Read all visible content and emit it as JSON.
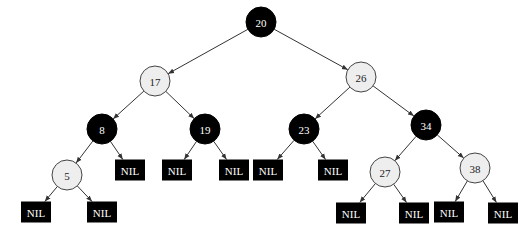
{
  "diagram": {
    "type": "red-black-tree",
    "colors": {
      "black_node_fill": "#000000",
      "black_node_text": "#ffffff",
      "red_node_fill": "#eeeeee",
      "red_node_stroke": "#444444",
      "red_node_text": "#222222",
      "nil_fill": "#000000",
      "nil_text": "#ffffff",
      "edge": "#333333"
    },
    "nodes": [
      {
        "id": "n20",
        "label": "20",
        "color": "black",
        "x": 261,
        "y": 22
      },
      {
        "id": "n17",
        "label": "17",
        "color": "red",
        "x": 155,
        "y": 81
      },
      {
        "id": "n26",
        "label": "26",
        "color": "red",
        "x": 361,
        "y": 77
      },
      {
        "id": "n8",
        "label": "8",
        "color": "black",
        "x": 102,
        "y": 129
      },
      {
        "id": "n19",
        "label": "19",
        "color": "black",
        "x": 205,
        "y": 129
      },
      {
        "id": "n23",
        "label": "23",
        "color": "black",
        "x": 304,
        "y": 129
      },
      {
        "id": "n34",
        "label": "34",
        "color": "black",
        "x": 426,
        "y": 125
      },
      {
        "id": "n5",
        "label": "5",
        "color": "red",
        "x": 67,
        "y": 175
      },
      {
        "id": "n27",
        "label": "27",
        "color": "red",
        "x": 385,
        "y": 172
      },
      {
        "id": "n38",
        "label": "38",
        "color": "red",
        "x": 475,
        "y": 168
      }
    ],
    "nil_nodes": [
      {
        "id": "nil8R",
        "label": "NIL",
        "x": 130,
        "y": 170
      },
      {
        "id": "nil19L",
        "label": "NIL",
        "x": 177,
        "y": 170
      },
      {
        "id": "nil19R",
        "label": "NIL",
        "x": 234,
        "y": 170
      },
      {
        "id": "nil23L",
        "label": "NIL",
        "x": 268,
        "y": 170
      },
      {
        "id": "nil23R",
        "label": "NIL",
        "x": 333,
        "y": 170
      },
      {
        "id": "nil5L",
        "label": "NIL",
        "x": 36,
        "y": 212
      },
      {
        "id": "nil5R",
        "label": "NIL",
        "x": 102,
        "y": 212
      },
      {
        "id": "nil27L",
        "label": "NIL",
        "x": 351,
        "y": 213
      },
      {
        "id": "nil27R",
        "label": "NIL",
        "x": 414,
        "y": 213
      },
      {
        "id": "nil38L",
        "label": "NIL",
        "x": 449,
        "y": 212
      },
      {
        "id": "nil38R",
        "label": "NIL",
        "x": 503,
        "y": 213
      }
    ],
    "edges": [
      [
        "n20",
        "n17"
      ],
      [
        "n20",
        "n26"
      ],
      [
        "n17",
        "n8"
      ],
      [
        "n17",
        "n19"
      ],
      [
        "n26",
        "n23"
      ],
      [
        "n26",
        "n34"
      ],
      [
        "n8",
        "n5"
      ],
      [
        "n8",
        "nil8R"
      ],
      [
        "n19",
        "nil19L"
      ],
      [
        "n19",
        "nil19R"
      ],
      [
        "n23",
        "nil23L"
      ],
      [
        "n23",
        "nil23R"
      ],
      [
        "n34",
        "n27"
      ],
      [
        "n34",
        "n38"
      ],
      [
        "n5",
        "nil5L"
      ],
      [
        "n5",
        "nil5R"
      ],
      [
        "n27",
        "nil27L"
      ],
      [
        "n27",
        "nil27R"
      ],
      [
        "n38",
        "nil38L"
      ],
      [
        "n38",
        "nil38R"
      ]
    ]
  }
}
